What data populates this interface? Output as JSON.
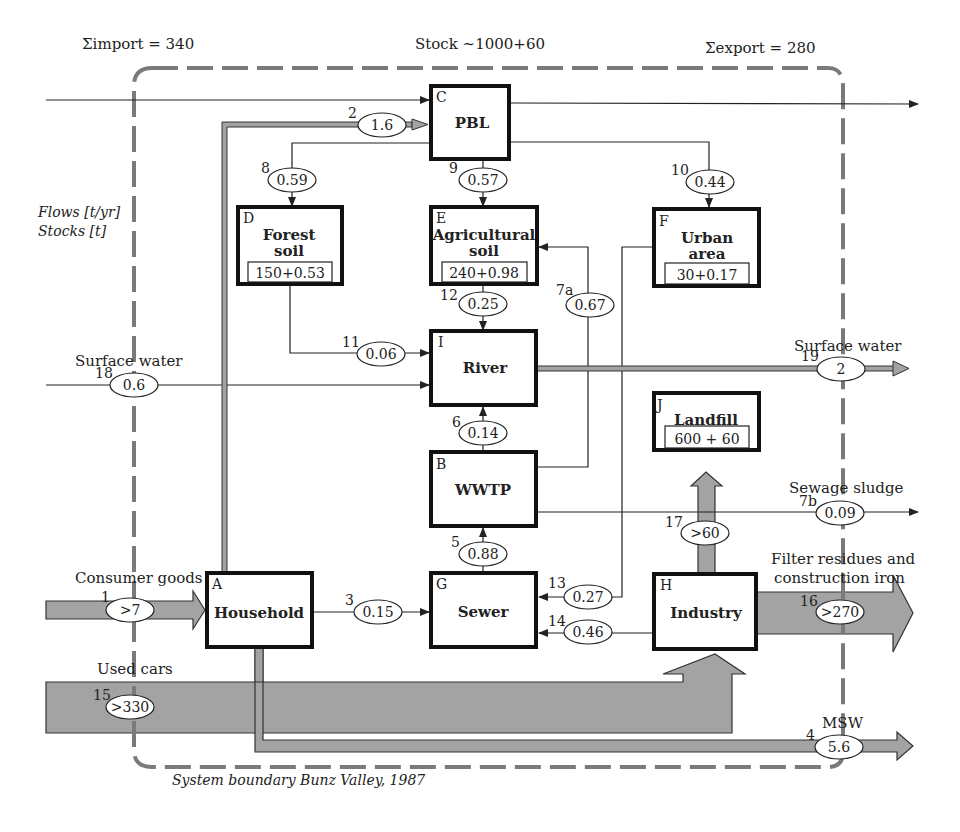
{
  "header": {
    "import_label": "Σimport = 340",
    "stock_label": "Stock ~1000+60",
    "export_label": "Σexport = 280"
  },
  "legend": {
    "flows": "Flows [t/yr]",
    "stocks": "Stocks [t]"
  },
  "boundary": {
    "caption": "System boundary Bunz Valley, 1987"
  },
  "colors": {
    "box_border": "#111111",
    "boundary": "#777777",
    "wide_flow_fill": "#9e9e9e",
    "line": "#222222"
  },
  "processes": {
    "A": {
      "letter": "A",
      "title": "Household"
    },
    "B": {
      "letter": "B",
      "title": "WWTP"
    },
    "C": {
      "letter": "C",
      "title": "PBL"
    },
    "D": {
      "letter": "D",
      "title_line1": "Forest",
      "title_line2": "soil",
      "stock": "150+0.53"
    },
    "E": {
      "letter": "E",
      "title_line1": "Agricultural",
      "title_line2": "soil",
      "stock": "240+0.98"
    },
    "F": {
      "letter": "F",
      "title_line1": "Urban",
      "title_line2": "area",
      "stock": "30+0.17"
    },
    "G": {
      "letter": "G",
      "title": "Sewer"
    },
    "H": {
      "letter": "H",
      "title": "Industry"
    },
    "I": {
      "letter": "I",
      "title": "River"
    },
    "J": {
      "letter": "J",
      "title": "Landfill",
      "stock": "600 + 60"
    }
  },
  "flows": {
    "f1": {
      "id": "1",
      "value": ">7",
      "label": "Consumer goods"
    },
    "f2": {
      "id": "2",
      "value": "1.6"
    },
    "f3": {
      "id": "3",
      "value": "0.15"
    },
    "f4": {
      "id": "4",
      "value": "5.6",
      "label": "MSW"
    },
    "f5": {
      "id": "5",
      "value": "0.88"
    },
    "f6": {
      "id": "6",
      "value": "0.14"
    },
    "f7a": {
      "id": "7a",
      "value": "0.67"
    },
    "f7b": {
      "id": "7b",
      "value": "0.09",
      "label": "Sewage sludge"
    },
    "f8": {
      "id": "8",
      "value": "0.59"
    },
    "f9": {
      "id": "9",
      "value": "0.57"
    },
    "f10": {
      "id": "10",
      "value": "0.44"
    },
    "f11": {
      "id": "11",
      "value": "0.06"
    },
    "f12": {
      "id": "12",
      "value": "0.25"
    },
    "f13": {
      "id": "13",
      "value": "0.27"
    },
    "f14": {
      "id": "14",
      "value": "0.46"
    },
    "f15": {
      "id": "15",
      "value": ">330",
      "label": "Used cars"
    },
    "f16": {
      "id": "16",
      "value": ">270",
      "label_line1": "Filter residues and",
      "label_line2": "construction iron"
    },
    "f17": {
      "id": "17",
      "value": ">60"
    },
    "f18": {
      "id": "18",
      "value": "0.6",
      "label": "Surface water"
    },
    "f19": {
      "id": "19",
      "value": "2",
      "label": "Surface water"
    }
  }
}
